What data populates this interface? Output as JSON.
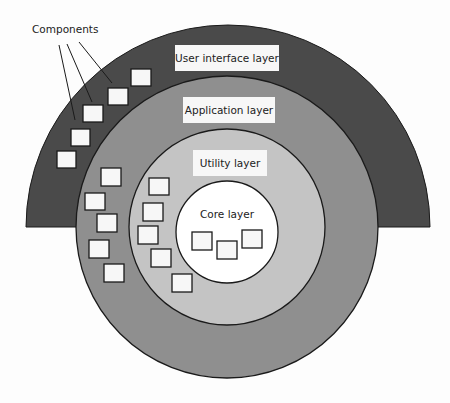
{
  "diagram": {
    "title_callout": "Components",
    "layers": [
      {
        "id": "ui",
        "label": "User interface layer",
        "color": "#4a4a4a"
      },
      {
        "id": "application",
        "label": "Application layer",
        "color": "#8f8f8f"
      },
      {
        "id": "utility",
        "label": "Utility layer",
        "color": "#c2c2c2"
      },
      {
        "id": "core",
        "label": "Core layer",
        "color": "#ffffff"
      }
    ],
    "components": {
      "ui": 5,
      "application": 5,
      "utility": 5,
      "core": 3
    }
  }
}
